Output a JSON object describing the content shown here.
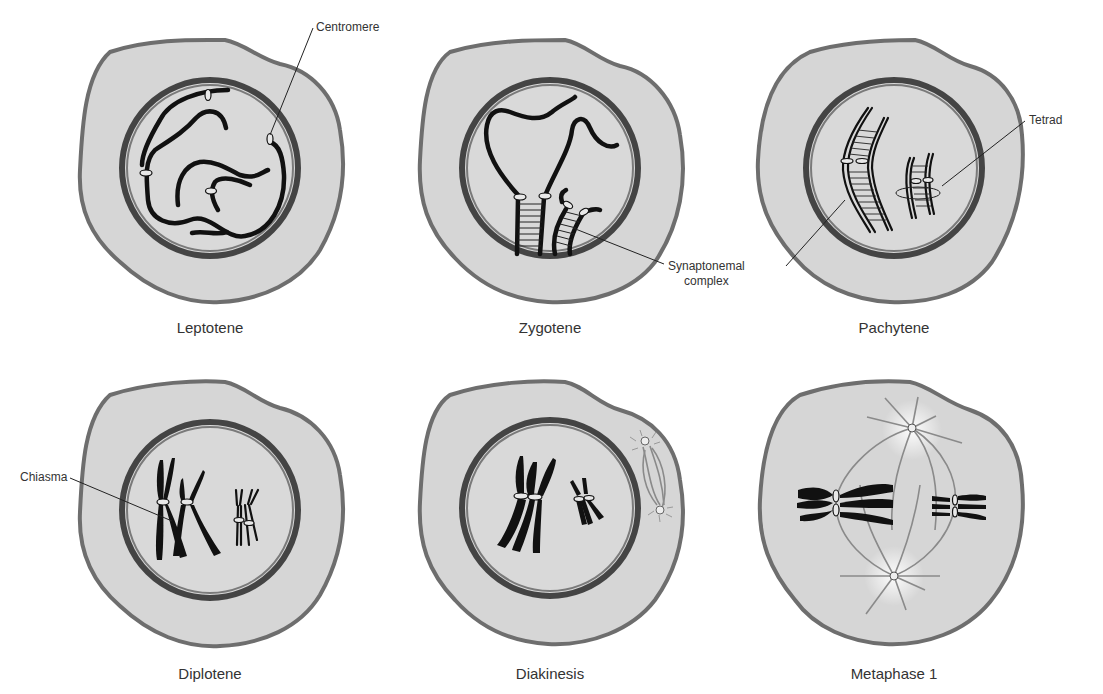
{
  "figure": {
    "colors": {
      "cytoplasm": "#d6d6d6",
      "cell_membrane": "#6e6e6e",
      "nuclear_envelope": "#444444",
      "chromosome": "#111111",
      "centromere": "#e8e8e8",
      "spindle": "#8a8a8a",
      "label_text": "#333333"
    }
  },
  "panels": [
    {
      "id": "leptotene",
      "label": "Leptotene",
      "callouts": [
        {
          "text": "Centromere"
        }
      ]
    },
    {
      "id": "zygotene",
      "label": "Zygotene",
      "callouts": [
        {
          "line1": "Synaptonemal",
          "line2": "complex"
        }
      ]
    },
    {
      "id": "pachytene",
      "label": "Pachytene",
      "callouts": [
        {
          "text": "Tetrad"
        }
      ]
    },
    {
      "id": "diplotene",
      "label": "Diplotene",
      "callouts": [
        {
          "text": "Chiasma"
        }
      ]
    },
    {
      "id": "diakinesis",
      "label": "Diakinesis",
      "callouts": []
    },
    {
      "id": "metaphase1",
      "label": "Metaphase 1",
      "callouts": []
    }
  ]
}
